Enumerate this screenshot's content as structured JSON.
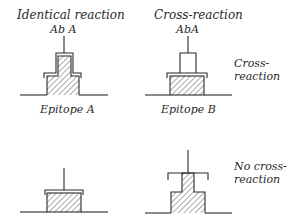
{
  "panels": {
    "top_left": {
      "title": "Identical reaction",
      "antibody_label": "Ab A"
    },
    "top_right": {
      "title": "Cross-reaction",
      "antibody_label": "AbA"
    }
  },
  "epitopes": {
    "a": "Epitope A",
    "b": "Epitope B"
  },
  "row_labels": {
    "top": {
      "line1": "Cross-",
      "line2": "reaction"
    },
    "bottom": {
      "line1": "No cross-",
      "line2": "reaction"
    }
  },
  "colors": {
    "ink": "#2a2a2a",
    "background": "#ffffff"
  }
}
